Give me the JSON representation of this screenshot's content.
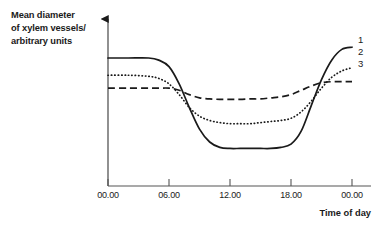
{
  "chart_data": {
    "type": "line",
    "title": "",
    "xlabel": "Time of day",
    "ylabel": "Mean diameter of xylem vessels/ arbitrary units",
    "ylabel_lines": [
      "Mean diameter",
      "of xylem vessels/",
      "arbitrary units"
    ],
    "x_tick_labels": [
      "00.00",
      "06.00",
      "12.00",
      "18.00",
      "00.00"
    ],
    "x_tick_values": [
      0,
      6,
      12,
      18,
      24
    ],
    "xlim": [
      0,
      24
    ],
    "ylim": [
      0,
      10
    ],
    "y_axis_ticks_shown": false,
    "grid": false,
    "legend_position": "right-of-curve-ends",
    "axis_arrow_on_y": true,
    "series": [
      {
        "name": "1",
        "label": "1",
        "linestyle": "solid",
        "color": "#1a1a1a",
        "x": [
          0,
          2,
          4,
          5,
          6,
          7,
          8,
          9,
          10,
          11,
          12,
          13,
          14,
          15,
          16,
          17,
          18,
          19,
          20,
          21,
          22,
          23,
          24
        ],
        "values": [
          8.2,
          8.2,
          8.2,
          8.1,
          7.8,
          7.0,
          5.9,
          4.9,
          4.3,
          4.05,
          4.0,
          4.0,
          4.0,
          4.0,
          4.0,
          4.05,
          4.2,
          4.8,
          6.0,
          7.2,
          8.1,
          8.6,
          8.7
        ]
      },
      {
        "name": "2",
        "label": "2",
        "linestyle": "dotted",
        "color": "#1a1a1a",
        "x": [
          0,
          2,
          4,
          5,
          6,
          7,
          8,
          9,
          10,
          11,
          12,
          13,
          14,
          15,
          16,
          17,
          18,
          19,
          20,
          21,
          22,
          23,
          24
        ],
        "values": [
          7.4,
          7.4,
          7.35,
          7.25,
          7.0,
          6.5,
          5.9,
          5.5,
          5.3,
          5.2,
          5.15,
          5.15,
          5.15,
          5.2,
          5.25,
          5.3,
          5.4,
          5.7,
          6.2,
          6.8,
          7.3,
          7.6,
          7.75
        ]
      },
      {
        "name": "3",
        "label": "3",
        "linestyle": "dashed",
        "color": "#1a1a1a",
        "x": [
          0,
          2,
          4,
          5,
          6,
          7,
          8,
          9,
          10,
          11,
          12,
          13,
          14,
          15,
          16,
          17,
          18,
          19,
          20,
          21,
          22,
          23,
          24
        ],
        "values": [
          6.8,
          6.8,
          6.8,
          6.8,
          6.8,
          6.7,
          6.5,
          6.35,
          6.3,
          6.28,
          6.28,
          6.28,
          6.3,
          6.3,
          6.35,
          6.4,
          6.5,
          6.7,
          6.9,
          7.05,
          7.1,
          7.1,
          7.1
        ]
      }
    ]
  }
}
